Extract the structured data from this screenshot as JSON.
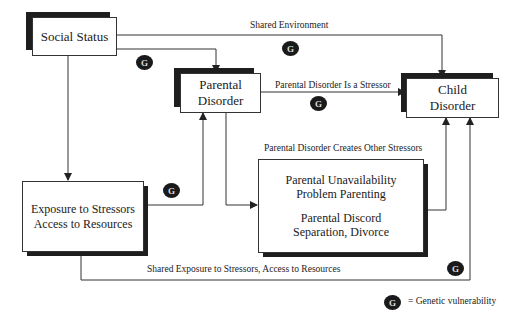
{
  "diagram": {
    "nodes": {
      "social_status": {
        "label": "Social Status"
      },
      "parental_disorder": {
        "line1": "Parental",
        "line2": "Disorder"
      },
      "child_disorder": {
        "line1": "Child",
        "line2": "Disorder"
      },
      "exposure": {
        "line1": "Exposure to Stressors",
        "line2": "Access to Resources"
      },
      "other_stressors": {
        "line1": "Parental Unavailability",
        "line2": "Problem Parenting",
        "line3": "Parental Discord",
        "line4": "Separation, Divorce"
      }
    },
    "edges": {
      "shared_environment": "Shared Environment",
      "parental_is_stressor": "Parental Disorder Is a Stressor",
      "creates_other_stressors": "Parental Disorder Creates Other Stressors",
      "shared_exposure": "Shared Exposure to Stressors, Access to Resources"
    },
    "genetic_badge": "G",
    "legend": {
      "symbol": "G",
      "text": "= Genetic vulnerability"
    }
  }
}
